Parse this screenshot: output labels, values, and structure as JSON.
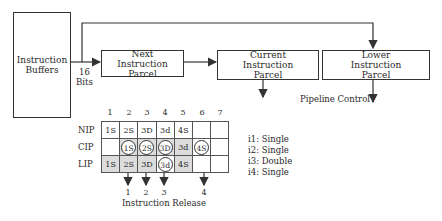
{
  "blocks": {
    "instruction_buffers": "Instruction Buffers",
    "next_parcel": "Next Instruction Parcel",
    "current_parcel": "Current Instruction Parcel",
    "lower_parcel": "Lower Instruction Parcel"
  },
  "bus_label": {
    "line1": "16",
    "line2": "Bits"
  },
  "pipeline_control": "Pipeline Control",
  "grid": {
    "columns": [
      "1",
      "2",
      "3",
      "4",
      "5",
      "6",
      "7"
    ],
    "rows": [
      {
        "label": "NIP",
        "cells": [
          "1S",
          "2S",
          "3D",
          "3d",
          "4S",
          "",
          ""
        ]
      },
      {
        "label": "CIP",
        "cells": [
          "",
          "1S",
          "2S",
          "3D",
          "3d",
          "4S",
          ""
        ]
      },
      {
        "label": "LIP",
        "cells": [
          "1S",
          "2S",
          "3D",
          "3d",
          "4S",
          "",
          ""
        ]
      }
    ]
  },
  "release": {
    "numbers": [
      "1",
      "2",
      "3",
      "4"
    ],
    "label": "Instruction Release"
  },
  "legend": [
    "i1: Single",
    "i2: Single",
    "i3: Double",
    "i4: Single"
  ]
}
